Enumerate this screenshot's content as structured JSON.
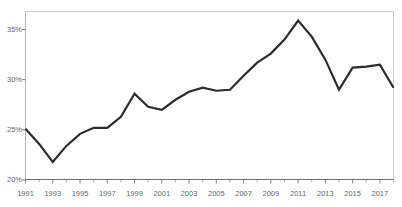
{
  "chart_data": {
    "type": "line",
    "title": "",
    "xlabel": "",
    "ylabel": "",
    "x": [
      1991,
      1992,
      1993,
      1994,
      1995,
      1996,
      1997,
      1998,
      1999,
      2000,
      2001,
      2002,
      2003,
      2004,
      2005,
      2006,
      2007,
      2008,
      2009,
      2010,
      2011,
      2012,
      2013,
      2014,
      2015,
      2016,
      2017,
      2018
    ],
    "values": [
      25.1,
      23.6,
      21.8,
      23.4,
      24.6,
      25.2,
      25.2,
      26.3,
      28.6,
      27.3,
      27.0,
      28.0,
      28.8,
      29.2,
      28.9,
      29.0,
      30.4,
      31.7,
      32.6,
      34.0,
      35.9,
      34.3,
      32.0,
      29.0,
      31.2,
      31.3,
      31.5,
      29.2
    ],
    "series": [
      {
        "name": "value",
        "points": [
          {
            "x": 1991,
            "y": 25.1
          },
          {
            "x": 1992,
            "y": 23.6
          },
          {
            "x": 1993,
            "y": 21.8
          },
          {
            "x": 1994,
            "y": 23.4
          },
          {
            "x": 1995,
            "y": 24.6
          },
          {
            "x": 1996,
            "y": 25.2
          },
          {
            "x": 1997,
            "y": 25.2
          },
          {
            "x": 1998,
            "y": 26.3
          },
          {
            "x": 1999,
            "y": 28.6
          },
          {
            "x": 2000,
            "y": 27.3
          },
          {
            "x": 2001,
            "y": 27.0
          },
          {
            "x": 2002,
            "y": 28.0
          },
          {
            "x": 2003,
            "y": 28.8
          },
          {
            "x": 2004,
            "y": 29.2
          },
          {
            "x": 2005,
            "y": 28.9
          },
          {
            "x": 2006,
            "y": 29.0
          },
          {
            "x": 2007,
            "y": 30.4
          },
          {
            "x": 2008,
            "y": 31.7
          },
          {
            "x": 2009,
            "y": 32.6
          },
          {
            "x": 2010,
            "y": 34.0
          },
          {
            "x": 2011,
            "y": 35.9
          },
          {
            "x": 2012,
            "y": 34.3
          },
          {
            "x": 2013,
            "y": 32.0
          },
          {
            "x": 2014,
            "y": 29.0
          },
          {
            "x": 2015,
            "y": 31.2
          },
          {
            "x": 2016,
            "y": 31.3
          },
          {
            "x": 2017,
            "y": 31.5
          },
          {
            "x": 2018,
            "y": 29.2
          }
        ]
      }
    ],
    "xlim": [
      1991,
      2018
    ],
    "ylim": [
      20,
      36.8
    ],
    "yticks": [
      20,
      25,
      30,
      35
    ],
    "ytick_labels": [
      "20%",
      "25%",
      "30%",
      "35%"
    ],
    "xticks": [
      1991,
      1993,
      1995,
      1997,
      1999,
      2001,
      2003,
      2005,
      2007,
      2009,
      2011,
      2013,
      2015,
      2017
    ],
    "xtick_labels": [
      "1991",
      "1993",
      "1995",
      "1997",
      "1999",
      "2001",
      "2003",
      "2005",
      "2007",
      "2009",
      "2011",
      "2013",
      "2015",
      "2017"
    ],
    "xtick_minor": [
      1992,
      1994,
      1996,
      1998,
      2000,
      2002,
      2004,
      2006,
      2008,
      2010,
      2012,
      2014,
      2016,
      2018
    ],
    "grid": false,
    "legend": null,
    "line_color": "#2b2b2b",
    "line_width": 2.2,
    "axis_color": "#6e6e6e",
    "frame_color": "#c9c9c9",
    "tick_label_color": "#666666",
    "background_color": "#ffffff"
  }
}
